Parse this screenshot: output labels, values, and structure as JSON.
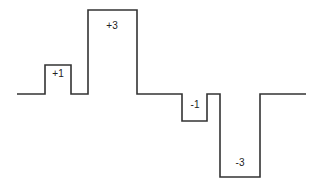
{
  "diagram": {
    "type": "step-waveform",
    "line_color": "#333333",
    "baseline_y": 94,
    "path_points": [
      [
        17,
        94
      ],
      [
        45,
        94
      ],
      [
        45,
        65
      ],
      [
        71,
        65
      ],
      [
        71,
        94
      ],
      [
        88,
        94
      ],
      [
        88,
        10
      ],
      [
        137,
        10
      ],
      [
        137,
        94
      ],
      [
        182,
        94
      ],
      [
        182,
        121
      ],
      [
        207,
        121
      ],
      [
        207,
        94
      ],
      [
        220,
        94
      ],
      [
        220,
        177
      ],
      [
        260,
        177
      ],
      [
        260,
        94
      ],
      [
        306,
        94
      ]
    ],
    "pulses": [
      {
        "label": "+1",
        "x": 58,
        "y": 77
      },
      {
        "label": "+3",
        "x": 112,
        "y": 29
      },
      {
        "label": "-1",
        "x": 195,
        "y": 108
      },
      {
        "label": "-3",
        "x": 240,
        "y": 166
      }
    ]
  }
}
